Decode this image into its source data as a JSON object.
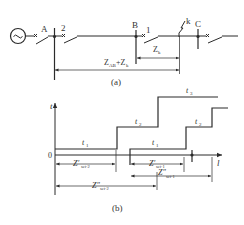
{
  "diagram_a": {
    "caption": "(a)",
    "source_symbol": "~",
    "bus_labels": [
      "A",
      "B",
      "C"
    ],
    "breaker_labels": [
      "2",
      "1"
    ],
    "fault_label": "k",
    "dimensions": {
      "zk": "Z",
      "zk_sub": "k",
      "zab_zk_main": "Z",
      "zab_zk_sub": "AB",
      "zab_zk_plus": "+Z",
      "zab_zk_sub2": "k"
    }
  },
  "diagram_b": {
    "caption": "(b)",
    "y_axis_label": "t",
    "x_axis_label": "l",
    "origin_label": "0",
    "stage_labels_left": {
      "t1": "t",
      "t1_sub": "1",
      "t2": "t",
      "t2_sub": "2",
      "t3": "t",
      "t3_sub": "3"
    },
    "stage_labels_right": {
      "t1": "t",
      "t1_sub": "1",
      "t2": "t",
      "t2_sub": "2"
    },
    "dimensions": {
      "zset2_prime": "Z′",
      "zset2_prime_sub": "set·2",
      "zset1_prime": "Z′",
      "zset1_prime_sub": "set·1",
      "zset1_dprime": "Z″",
      "zset1_dprime_sub": "set·1",
      "zset2_dprime": "Z″",
      "zset2_dprime_sub": "set·2"
    }
  }
}
